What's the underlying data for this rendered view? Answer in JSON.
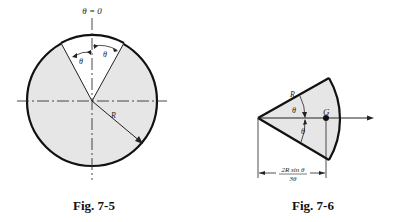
{
  "figures": [
    {
      "id": "fig-7-5",
      "caption": "Fig. 7-5",
      "top_label": "θ = 0",
      "angle_left_label": "θ",
      "angle_right_label": "θ",
      "radius_label": "R",
      "fill_color": "#e6e6e6",
      "stroke_color": "#111111"
    },
    {
      "id": "fig-7-6",
      "caption": "Fig. 7-6",
      "radius_label": "R",
      "angle_upper_label": "θ",
      "angle_lower_label": "θ",
      "centroid_label": "G",
      "dimension_numerator": "2R sin θ",
      "dimension_denominator": "3θ",
      "fill_color": "#e6e6e6",
      "stroke_color": "#111111"
    }
  ]
}
